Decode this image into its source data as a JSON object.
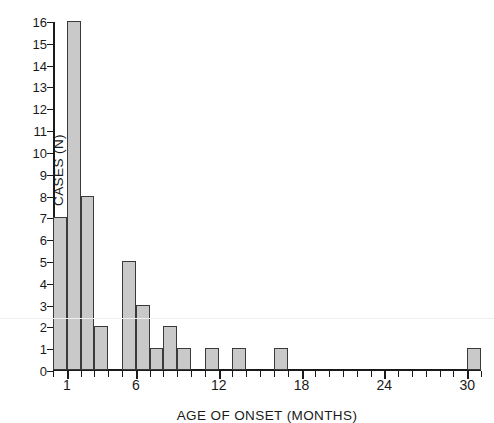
{
  "chart_data": {
    "type": "bar",
    "title": "",
    "xlabel": "AGE OF ONSET (MONTHS)",
    "ylabel": "CASES (N)",
    "xlim": [
      0,
      31
    ],
    "ylim": [
      0,
      16
    ],
    "grid": false,
    "legend": null,
    "bin_width": 1,
    "x_tick_labels": [
      "1",
      "6",
      "12",
      "18",
      "24",
      "30"
    ],
    "x_tick_values": [
      1,
      6,
      12,
      18,
      24,
      30
    ],
    "x_minor_ticks_every": 1,
    "y_tick_labels": [
      "0",
      "1",
      "2",
      "3",
      "4",
      "5",
      "6",
      "7",
      "8",
      "9",
      "10",
      "11",
      "12",
      "13",
      "14",
      "15",
      "16"
    ],
    "y_tick_values": [
      0,
      1,
      2,
      3,
      4,
      5,
      6,
      7,
      8,
      9,
      10,
      11,
      12,
      13,
      14,
      15,
      16
    ],
    "categories": [
      0,
      1,
      2,
      3,
      4,
      5,
      6,
      7,
      8,
      9,
      10,
      11,
      12,
      13,
      14,
      15,
      16,
      17,
      18,
      19,
      20,
      21,
      22,
      23,
      24,
      25,
      26,
      27,
      28,
      29,
      30
    ],
    "values": [
      7,
      16,
      8,
      2,
      0,
      5,
      3,
      1,
      2,
      1,
      0,
      1,
      0,
      1,
      0,
      0,
      1,
      0,
      0,
      0,
      0,
      0,
      0,
      0,
      0,
      0,
      0,
      0,
      0,
      0,
      1
    ],
    "bars": [
      {
        "bin_start": 0,
        "bin_end": 1,
        "count": 7
      },
      {
        "bin_start": 1,
        "bin_end": 2,
        "count": 16
      },
      {
        "bin_start": 2,
        "bin_end": 3,
        "count": 8
      },
      {
        "bin_start": 3,
        "bin_end": 4,
        "count": 2
      },
      {
        "bin_start": 5,
        "bin_end": 6,
        "count": 5
      },
      {
        "bin_start": 6,
        "bin_end": 7,
        "count": 3
      },
      {
        "bin_start": 7,
        "bin_end": 8,
        "count": 1
      },
      {
        "bin_start": 8,
        "bin_end": 9,
        "count": 2
      },
      {
        "bin_start": 9,
        "bin_end": 10,
        "count": 1
      },
      {
        "bin_start": 11,
        "bin_end": 12,
        "count": 1
      },
      {
        "bin_start": 13,
        "bin_end": 14,
        "count": 1
      },
      {
        "bin_start": 16,
        "bin_end": 17,
        "count": 1
      },
      {
        "bin_start": 30,
        "bin_end": 31,
        "count": 1
      }
    ],
    "total_cases": 49,
    "colors": {
      "bar_fill": "#c9c9c9",
      "bar_edge": "#3a3a3a",
      "axis": "#1a1a1a",
      "text": "#1a1a1a",
      "background": "#ffffff"
    }
  }
}
